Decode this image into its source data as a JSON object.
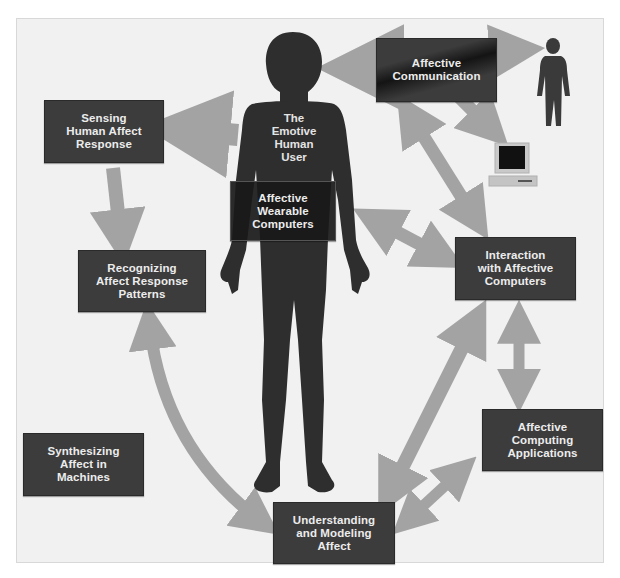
{
  "diagram": {
    "center_figure": {
      "label": "The\nEmotive\nHuman\nUser"
    },
    "nodes": [
      {
        "id": "sensing",
        "label": "Sensing\nHuman Affect\nResponse"
      },
      {
        "id": "recognizing",
        "label": "Recognizing\nAffect Response\nPatterns"
      },
      {
        "id": "synthesizing",
        "label": "Synthesizing\nAffect in\nMachines"
      },
      {
        "id": "understanding",
        "label": "Understanding\nand Modeling\nAffect"
      },
      {
        "id": "applications",
        "label": "Affective\nComputing\nApplications"
      },
      {
        "id": "interaction",
        "label": "Interaction\nwith Affective\nComputers"
      },
      {
        "id": "communication",
        "label": "Affective\nCommunication"
      },
      {
        "id": "wearable",
        "label": "Affective\nWearable\nComputers"
      }
    ],
    "edges": [
      {
        "from": "center_figure",
        "to": "sensing",
        "direction": "one-way"
      },
      {
        "from": "sensing",
        "to": "recognizing",
        "direction": "one-way"
      },
      {
        "from": "recognizing",
        "to": "understanding",
        "direction": "two-way"
      },
      {
        "from": "understanding",
        "to": "interaction",
        "direction": "two-way"
      },
      {
        "from": "understanding",
        "to": "applications",
        "direction": "two-way"
      },
      {
        "from": "interaction",
        "to": "applications",
        "direction": "two-way"
      },
      {
        "from": "interaction",
        "to": "center_figure",
        "direction": "two-way"
      },
      {
        "from": "interaction",
        "to": "communication",
        "direction": "two-way"
      },
      {
        "from": "communication",
        "to": "center_figure",
        "direction": "one-way"
      },
      {
        "from": "communication",
        "to": "other_person",
        "direction": "one-way"
      },
      {
        "from": "communication",
        "to": "computer",
        "direction": "one-way"
      }
    ],
    "icons": [
      "human-silhouette-large",
      "human-silhouette-small",
      "computer-icon"
    ],
    "colors": {
      "box": "#3c3c3c",
      "arrow": "#a0a0a0",
      "figure": "#2e2e2e",
      "background": "#f1f1f1",
      "text": "#ececec"
    }
  }
}
